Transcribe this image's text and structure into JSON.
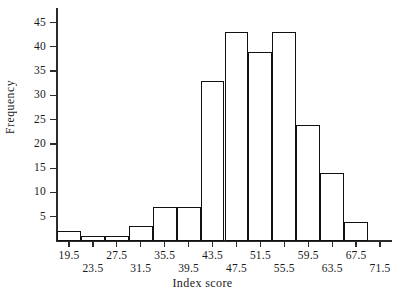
{
  "chart_data": {
    "type": "bar",
    "title": "",
    "subtitle": "",
    "xlabel": "Index score",
    "ylabel": "Frequency",
    "grid": false,
    "legend": null,
    "legend_position": "none",
    "bin_width": 4,
    "bin_edges": [
      17.5,
      21.5,
      25.5,
      29.5,
      33.5,
      37.5,
      41.5,
      45.5,
      49.5,
      53.5,
      57.5,
      61.5,
      65.5,
      69.5
    ],
    "categories": [
      "17.5-21.5",
      "21.5-25.5",
      "25.5-29.5",
      "29.5-33.5",
      "33.5-37.5",
      "37.5-41.5",
      "41.5-45.5",
      "45.5-49.5",
      "49.5-53.5",
      "53.5-57.5",
      "57.5-61.5",
      "61.5-65.5",
      "65.5-69.5"
    ],
    "values": [
      2,
      1,
      1,
      3,
      7,
      7,
      33,
      43,
      39,
      43,
      24,
      14,
      4
    ],
    "x": [
      19.5,
      23.5,
      27.5,
      31.5,
      35.5,
      39.5,
      43.5,
      47.5,
      51.5,
      55.5,
      59.5,
      63.5,
      67.5
    ],
    "xlim": [
      17.5,
      73.5
    ],
    "ylim": [
      0,
      48
    ],
    "x_tick_labels": [
      "19.5",
      "23.5",
      "27.5",
      "31.5",
      "35.5",
      "39.5",
      "43.5",
      "47.5",
      "51.5",
      "55.5",
      "59.5",
      "63.5",
      "67.5",
      "71.5"
    ],
    "x_tick_values": [
      19.5,
      23.5,
      27.5,
      31.5,
      35.5,
      39.5,
      43.5,
      47.5,
      51.5,
      55.5,
      59.5,
      63.5,
      67.5,
      71.5
    ],
    "y_tick_labels": [
      "5",
      "10",
      "15",
      "20",
      "25",
      "30",
      "35",
      "40",
      "45"
    ],
    "y_tick_values": [
      5,
      10,
      15,
      20,
      25,
      30,
      35,
      40,
      45
    ],
    "colors": {
      "bar_fill": "#ffffff",
      "bar_edge": "#111111",
      "axis": "#2b2b2b",
      "text": "#1a1a1a",
      "background": "#ffffff"
    }
  }
}
